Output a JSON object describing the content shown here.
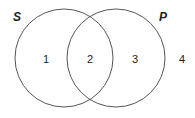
{
  "diagram": {
    "type": "venn",
    "stroke_color": "#555555",
    "background": "#ffffff",
    "sets": [
      {
        "label": "S",
        "cx": 64,
        "cy": 58,
        "r": 49
      },
      {
        "label": "P",
        "cx": 116,
        "cy": 58,
        "r": 49
      }
    ],
    "regions": [
      {
        "label": "1",
        "description": "S only"
      },
      {
        "label": "2",
        "description": "S and P"
      },
      {
        "label": "3",
        "description": "P only"
      },
      {
        "label": "4",
        "description": "outside both"
      }
    ]
  }
}
